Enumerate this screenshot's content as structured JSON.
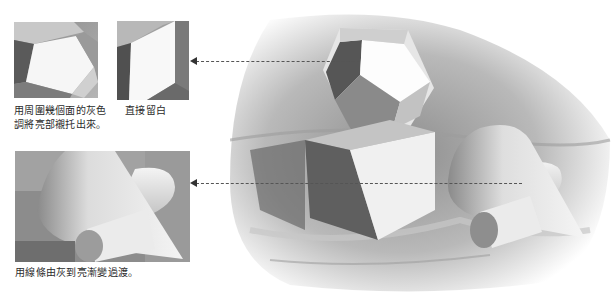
{
  "illustration": {
    "subject": "pencil still-life drawing of geometric solids",
    "objects": [
      "dodecahedron",
      "cube",
      "cone",
      "cylinder",
      "drapery"
    ],
    "palette": {
      "paper": "#ffffff",
      "light": "#f2f2f2",
      "mid": "#a8a8a8",
      "dark": "#4a4a4a",
      "line": "#555555"
    }
  },
  "details": [
    {
      "id": "detail-polyhedron-surround",
      "caption_line1": "用周圍幾個面的灰色",
      "caption_line2": "調將亮部襯托出來。"
    },
    {
      "id": "detail-cube-edge",
      "caption_line1": "直接留白"
    },
    {
      "id": "detail-cone-cylinder",
      "caption_line1": "用線條由灰到亮漸變過渡。"
    }
  ],
  "arrows": [
    {
      "from": "main-drawing-polyhedron",
      "to": "detail-cube-edge",
      "style": "dashed"
    },
    {
      "from": "main-drawing-cone",
      "to": "detail-cone-cylinder",
      "style": "dashed"
    }
  ]
}
